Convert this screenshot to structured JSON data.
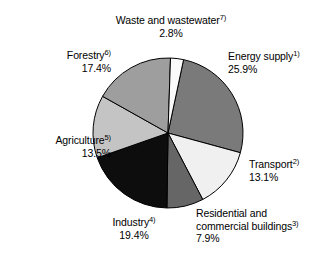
{
  "chart_data": {
    "type": "pie",
    "title": "",
    "legend_position": "none",
    "grid": false,
    "start_angle_deg": 12,
    "direction": "clockwise",
    "center": [
      168,
      133
    ],
    "radius": 75,
    "categories": [
      "Energy supply",
      "Transport",
      "Residential and commercial buildings",
      "Industry",
      "Agriculture",
      "Forestry",
      "Waste and wastewater"
    ],
    "values": [
      25.9,
      13.1,
      7.9,
      19.4,
      13.5,
      17.4,
      2.8
    ],
    "slices": [
      {
        "name": "Energy supply",
        "footnote": "1)",
        "value": 25.9,
        "percent_label": "25.9%",
        "color": "#7a7a7a",
        "label_line1": "Energy supply",
        "label_line2": null
      },
      {
        "name": "Transport",
        "footnote": "2)",
        "value": 13.1,
        "percent_label": "13.1%",
        "color": "#f0f0f0",
        "label_line1": "Transport",
        "label_line2": null
      },
      {
        "name": "Residential and commercial buildings",
        "footnote": "3)",
        "value": 7.9,
        "percent_label": "7.9%",
        "color": "#666666",
        "label_line1": "Residential and",
        "label_line2": "commercial buildings"
      },
      {
        "name": "Industry",
        "footnote": "4)",
        "value": 19.4,
        "percent_label": "19.4%",
        "color": "#0d0d0d",
        "label_line1": "Industry",
        "label_line2": null
      },
      {
        "name": "Agriculture",
        "footnote": "5)",
        "value": 13.5,
        "percent_label": "13.5%",
        "color": "#c4c4c4",
        "label_line1": "Agriculture",
        "label_line2": null
      },
      {
        "name": "Forestry",
        "footnote": "6)",
        "value": 17.4,
        "percent_label": "17.4%",
        "color": "#9e9e9e",
        "label_line1": "Forestry",
        "label_line2": null
      },
      {
        "name": "Waste and wastewater",
        "footnote": "7)",
        "value": 2.8,
        "percent_label": "2.8%",
        "color": "#fafafa",
        "label_line1": "Waste and wastewater",
        "label_line2": null
      }
    ],
    "xlabel": "",
    "ylabel": "",
    "stroke_color": "#000000"
  }
}
